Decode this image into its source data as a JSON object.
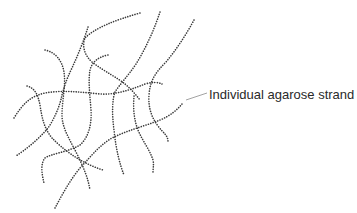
{
  "figure": {
    "annotation": {
      "label": "Individual agarose strand"
    },
    "style": {
      "strand_color": "#3a3a3a",
      "leader_color": "#8a8a8a",
      "background": "#ffffff"
    }
  }
}
